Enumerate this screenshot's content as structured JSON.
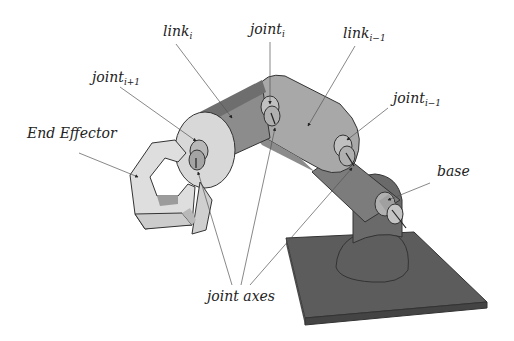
{
  "diagram": {
    "labels": {
      "link_i": {
        "base": "link",
        "sub": "i"
      },
      "joint_i": {
        "base": "joint",
        "sub": "i"
      },
      "link_im1": {
        "base": "link",
        "sub": "i−1"
      },
      "joint_ip1": {
        "base": "joint",
        "sub": "i+1"
      },
      "joint_im1": {
        "base": "joint",
        "sub": "i−1"
      },
      "end_effector": "End Effector",
      "base": "base",
      "joint_axes": "joint axes"
    },
    "colors": {
      "light_link": "#d2d2d2",
      "mid_link": "#a8a8a8",
      "dark_link": "#8a8a8a",
      "base_plate": "#5a5a5a",
      "gripper": "#dcdcdc",
      "background": "#ffffff"
    }
  }
}
